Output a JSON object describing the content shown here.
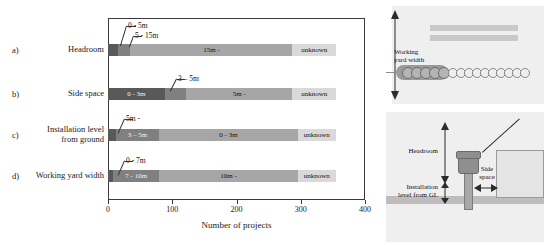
{
  "chart_data": {
    "type": "bar",
    "orientation": "horizontal",
    "stacked": true,
    "title": "",
    "xlabel": "Number of projects",
    "ylabel": "",
    "xlim": [
      0,
      400
    ],
    "xticks": [
      "0",
      "100",
      "200",
      "300",
      "400"
    ],
    "grid": false,
    "legend": "none (in-bar labels)",
    "categories": [
      {
        "letter": "a)",
        "name": "Headroom"
      },
      {
        "letter": "b)",
        "name": "Side space"
      },
      {
        "letter": "c)",
        "name": "Installation level\nfrom ground"
      },
      {
        "letter": "d)",
        "name": "Working yard width"
      }
    ],
    "rows": [
      {
        "letter": "a)",
        "name": "Headroom",
        "segments": [
          {
            "label": "0 - 5m",
            "value": 15,
            "color": "#595959",
            "label_placement": "callout"
          },
          {
            "label": "5 - 15m",
            "value": 20,
            "color": "#808080",
            "label_placement": "callout"
          },
          {
            "label": "15m -",
            "value": 252,
            "color": "#a6a6a6",
            "label_placement": "inside"
          },
          {
            "label": "unknown",
            "value": 68,
            "color": "#d9d9d9",
            "label_placement": "inside"
          }
        ]
      },
      {
        "letter": "b)",
        "name": "Side space",
        "segments": [
          {
            "label": "0 - 3m",
            "value": 88,
            "color": "#595959",
            "label_placement": "inside"
          },
          {
            "label": "3 – 5m",
            "value": 34,
            "color": "#808080",
            "label_placement": "callout"
          },
          {
            "label": "5m -",
            "value": 165,
            "color": "#a6a6a6",
            "label_placement": "inside"
          },
          {
            "label": "unknown",
            "value": 68,
            "color": "#d9d9d9",
            "label_placement": "inside"
          }
        ]
      },
      {
        "letter": "c)",
        "name": "Installation level\nfrom ground",
        "segments": [
          {
            "label": "5m -",
            "value": 12,
            "color": "#595959",
            "label_placement": "callout"
          },
          {
            "label": "3 – 5m",
            "value": 68,
            "color": "#808080",
            "label_placement": "inside"
          },
          {
            "label": "0 - 3m",
            "value": 215,
            "color": "#a6a6a6",
            "label_placement": "inside"
          },
          {
            "label": "unknown",
            "value": 60,
            "color": "#d9d9d9",
            "label_placement": "inside"
          }
        ]
      },
      {
        "letter": "d)",
        "name": "Working yard width",
        "segments": [
          {
            "label": "0 - 7m",
            "value": 8,
            "color": "#595959",
            "label_placement": "callout"
          },
          {
            "label": "7 - 10m",
            "value": 72,
            "color": "#808080",
            "label_placement": "inside"
          },
          {
            "label": "10m -",
            "value": 215,
            "color": "#a6a6a6",
            "label_placement": "inside"
          },
          {
            "label": "unknown",
            "value": 60,
            "color": "#d9d9d9",
            "label_placement": "inside"
          }
        ]
      }
    ],
    "colors": {
      "segment_1": "#595959",
      "segment_2": "#808080",
      "segment_3": "#a6a6a6",
      "segment_4_unknown": "#d9d9d9",
      "axis": "#3a3a3a"
    }
  },
  "diagrams": {
    "plan_view": {
      "label": "Working\nyard width"
    },
    "elevation_view": {
      "headroom_label": "Headroom",
      "installation_label": "Installation\nlevel from GL",
      "side_space_label": "Side\nspace"
    }
  }
}
